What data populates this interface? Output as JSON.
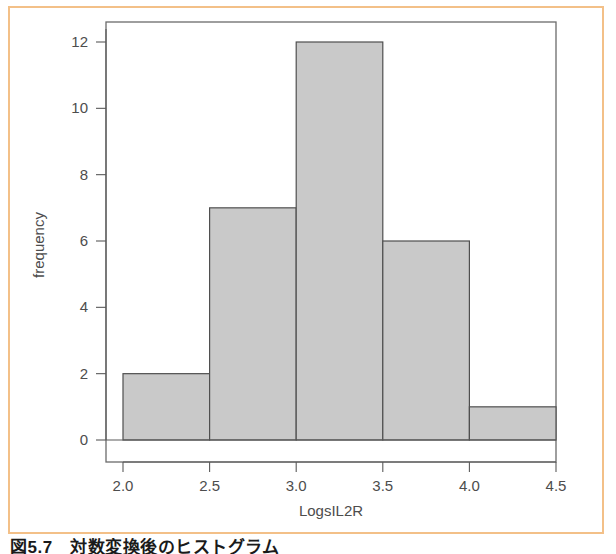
{
  "figure": {
    "caption": "図5.7　対数変換後のヒストグラム",
    "frame_color": "#f3c088",
    "background": "#ffffff"
  },
  "chart_data": {
    "type": "bar",
    "title": "",
    "subtitle": "",
    "xlabel": "LogsIL2R",
    "ylabel": "frequency",
    "categories": [
      "2.0-2.5",
      "2.5-3.0",
      "3.0-3.5",
      "3.5-4.0",
      "4.0-4.5"
    ],
    "bin_edges": [
      2.0,
      2.5,
      3.0,
      3.5,
      4.0,
      4.5
    ],
    "values": [
      2,
      7,
      12,
      6,
      1
    ],
    "x": [
      2.25,
      2.75,
      3.25,
      3.75,
      4.25
    ],
    "xlim": [
      2.0,
      4.5
    ],
    "ylim": [
      0,
      12
    ],
    "xticks": [
      "2.0",
      "2.5",
      "3.0",
      "3.5",
      "4.0",
      "4.5"
    ],
    "xtick_values": [
      2.0,
      2.5,
      3.0,
      3.5,
      4.0,
      4.5
    ],
    "yticks": [
      "0",
      "2",
      "4",
      "6",
      "8",
      "10",
      "12"
    ],
    "ytick_values": [
      0,
      2,
      4,
      6,
      8,
      10,
      12
    ],
    "grid": false,
    "legend": false,
    "bar_fill": "#c9c9c9",
    "bar_stroke": "#4f4f4f",
    "axis_color": "#5a5a5a",
    "total_count": 28
  }
}
